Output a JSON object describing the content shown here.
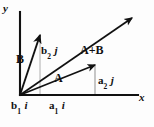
{
  "figure": {
    "background_color": "#fdfdfd",
    "stroke_color": "#111111",
    "guide_color": "#9a9a9a",
    "axes": {
      "x_label": "x",
      "y_label": "y",
      "origin": [
        20,
        95
      ],
      "x_end": [
        138,
        95
      ],
      "y_end": [
        20,
        12
      ]
    },
    "vectors": [
      {
        "name": "A",
        "label": "A",
        "from": [
          20,
          95
        ],
        "to": [
          95,
          65
        ],
        "label_pos": [
          54,
          72
        ]
      },
      {
        "name": "B",
        "label": "B",
        "from": [
          20,
          95
        ],
        "to": [
          40,
          35
        ],
        "label_pos": [
          16,
          53
        ]
      },
      {
        "name": "A+B",
        "label": "A+B",
        "from": [
          20,
          95
        ],
        "to": [
          132,
          18
        ],
        "label_pos": [
          80,
          44
        ]
      }
    ],
    "components": {
      "b2j": {
        "base": "b",
        "sub": "2",
        "unit": "j"
      },
      "a2j": {
        "base": "a",
        "sub": "2",
        "unit": "j"
      },
      "b1i": {
        "base": "b",
        "sub": "1",
        "unit": "i"
      },
      "a1i": {
        "base": "a",
        "sub": "1",
        "unit": "i"
      }
    },
    "guides": [
      {
        "name": "b2-projection",
        "from": [
          40,
          35
        ],
        "to": [
          40,
          95
        ]
      },
      {
        "name": "a2-projection",
        "from": [
          95,
          65
        ],
        "to": [
          95,
          95
        ]
      }
    ]
  }
}
